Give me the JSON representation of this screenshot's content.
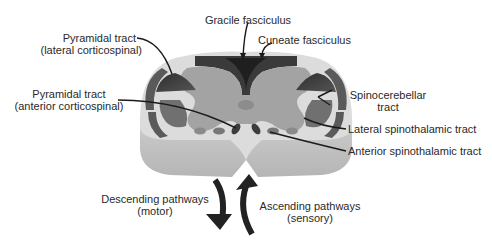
{
  "diagram": {
    "labels": {
      "gracile": "Gracile fasciculus",
      "cuneate": "Cuneate fasciculus",
      "pyramidal_lateral_line1": "Pyramidal tract",
      "pyramidal_lateral_line2": "(lateral corticospinal)",
      "pyramidal_anterior_line1": "Pyramidal tract",
      "pyramidal_anterior_line2": "(anterior corticospinal)",
      "spinocerebellar_line1": "Spinocerebellar",
      "spinocerebellar_line2": "tract",
      "lateral_spinothalamic": "Lateral spinothalamic tract",
      "anterior_spinothalamic": "Anterior spinothalamic tract",
      "descending_line1": "Descending pathways",
      "descending_line2": "(motor)",
      "ascending_line1": "Ascending pathways",
      "ascending_line2": "(sensory)"
    },
    "colors": {
      "white_matter": "#d9d9d9",
      "gray_matter": "#a8a8a8",
      "tract_dark": "#3a3a3a",
      "tract_mid": "#6e6e6e",
      "cord_side": "#c4c4c4",
      "text": "#2a2a2a"
    },
    "icons": {
      "descending_arrow": "arrow-down-curved",
      "ascending_arrow": "arrow-up-curved"
    }
  }
}
